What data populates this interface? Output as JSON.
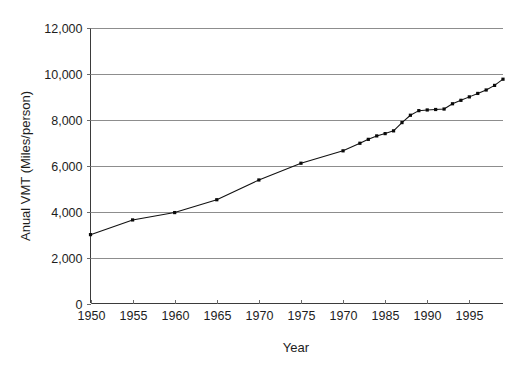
{
  "chart_data": {
    "type": "line",
    "title": "",
    "subtitle": "",
    "xlabel": "Year",
    "ylabel": "Anual VMT (Miles/person)",
    "xlim": [
      1950,
      1999
    ],
    "ylim": [
      0,
      12000
    ],
    "grid": "horizontal",
    "legend": "none",
    "x_tick_labels": [
      "1950",
      "1955",
      "1960",
      "1965",
      "1970",
      "1975",
      "1970",
      "1985",
      "1990",
      "1995"
    ],
    "x_tick_values": [
      1950,
      1955,
      1960,
      1965,
      1970,
      1975,
      1980,
      1985,
      1990,
      1995
    ],
    "y_tick_labels": [
      "0",
      "2,000",
      "4,000",
      "6,000",
      "8,000",
      "10,000",
      "12,000"
    ],
    "y_tick_values": [
      0,
      2000,
      4000,
      6000,
      8000,
      10000,
      12000
    ],
    "series": [
      {
        "name": "Annual VMT per person",
        "color": "#111111",
        "x": [
          1950,
          1955,
          1960,
          1965,
          1970,
          1975,
          1980,
          1982,
          1983,
          1984,
          1985,
          1986,
          1987,
          1988,
          1989,
          1990,
          1991,
          1992,
          1993,
          1994,
          1995,
          1996,
          1997,
          1998,
          1999
        ],
        "values": [
          3000,
          3640,
          3960,
          4520,
          5380,
          6110,
          6650,
          6980,
          7150,
          7300,
          7400,
          7520,
          7880,
          8200,
          8400,
          8430,
          8450,
          8470,
          8700,
          8850,
          9000,
          9150,
          9300,
          9500,
          9770
        ]
      }
    ],
    "annotations": []
  },
  "axes": {
    "x_axis_name": "year-axis",
    "y_axis_name": "vmt-axis"
  }
}
